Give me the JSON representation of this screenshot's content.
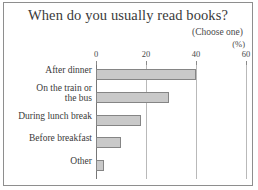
{
  "chart_data": {
    "type": "bar",
    "orientation": "horizontal",
    "title": "When do you usually read books?",
    "subtitle": "(Choose one)",
    "unit_label": "(%)",
    "xlabel": "",
    "ylabel": "",
    "xlim": [
      0,
      60
    ],
    "xticks": [
      0,
      20,
      40,
      60
    ],
    "xtick_labels": [
      "0",
      "20",
      "40",
      "60"
    ],
    "grid": true,
    "legend": false,
    "categories": [
      "After dinner",
      "On the train or\nthe bus",
      "During lunch break",
      "Before breakfast",
      "Other"
    ],
    "values": [
      40,
      29,
      18,
      10,
      3
    ],
    "bar_fill_color": "#c9c9c9",
    "bar_border_color": "#858585",
    "gridline_color": "#b9b9b9",
    "axis_color": "#777777",
    "frame_color": "#8e8e8e"
  }
}
